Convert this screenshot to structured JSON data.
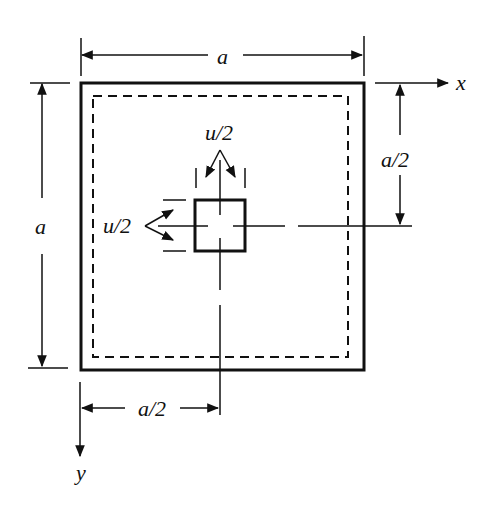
{
  "diagram": {
    "labels": {
      "top_dimension": "a",
      "left_dimension": "a",
      "right_half_dimension": "a/2",
      "bottom_half_dimension": "a/2",
      "x_axis": "x",
      "y_axis": "y",
      "top_load_width": "u/2",
      "left_load_width": "u/2"
    },
    "colors": {
      "stroke": "#111111",
      "background": "#ffffff"
    }
  }
}
